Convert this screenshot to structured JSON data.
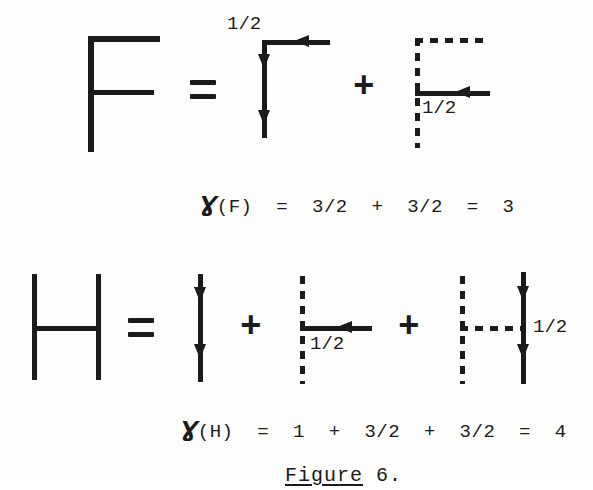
{
  "figure": {
    "label_word": "Figure",
    "label_number": " 6.",
    "caption_f": {
      "symbol": "Ɣ",
      "text": "(F)  =  3/2  +  3/2  =  3",
      "function_name": "gamma",
      "argument": "F",
      "terms": [
        "3/2",
        "3/2"
      ],
      "total": "3"
    },
    "caption_h": {
      "symbol": "Ɣ",
      "text": "(H)  =  1  +  3/2  +  3/2  =  4",
      "function_name": "gamma",
      "argument": "H",
      "terms": [
        "1",
        "3/2",
        "3/2"
      ],
      "total": "4"
    }
  },
  "equation_f": {
    "lhs_name": "F",
    "equals": "=",
    "operators": [
      "+"
    ],
    "term1_label": "1/2",
    "term2_label": "1/2"
  },
  "equation_h": {
    "lhs_name": "H",
    "equals": "=",
    "operators": [
      "+",
      "+"
    ],
    "term2_label": "1/2",
    "term3_label": "1/2"
  },
  "colors": {
    "ink": "#1b1b1b",
    "paper": "#fdfdfb"
  }
}
